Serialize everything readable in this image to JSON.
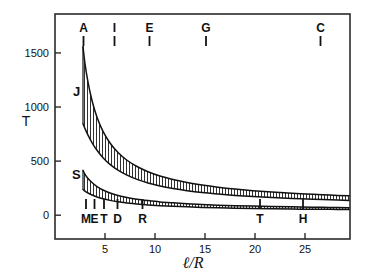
{
  "chart_data": {
    "type": "area",
    "title": "",
    "xlabel": "ℓ/R",
    "ylabel": "T",
    "xlim": [
      0,
      29.5
    ],
    "ylim": [
      -220,
      1860
    ],
    "grid": false,
    "legend": "none",
    "x_ticks": [
      5,
      10,
      15,
      20,
      25
    ],
    "x_tick_labels": [
      "5",
      "10",
      "15",
      "20",
      "25"
    ],
    "y_ticks": [
      0,
      500,
      1000,
      1500
    ],
    "y_tick_labels": [
      "0",
      "500",
      "1000",
      "1500"
    ],
    "series": [
      {
        "name": "J",
        "label": "J",
        "label_x": 3.0,
        "label_y": 1150,
        "fill": "hatch-vertical",
        "x": [
          2.8,
          3.0,
          3.3,
          3.7,
          4.2,
          4.8,
          5.5,
          6.3,
          7.2,
          8.2,
          9.3,
          10.5,
          11.8,
          13.2,
          14.7,
          16.3,
          18.0,
          19.8,
          21.7,
          23.7,
          25.8,
          27.5,
          29.4
        ],
        "upper": [
          1560,
          1400,
          1230,
          1060,
          905,
          775,
          668,
          580,
          508,
          450,
          402,
          362,
          330,
          302,
          279,
          259,
          242,
          227,
          214,
          203,
          193,
          186,
          179
        ],
        "lower": [
          845,
          800,
          740,
          672,
          600,
          532,
          470,
          416,
          370,
          331,
          298,
          270,
          247,
          227,
          210,
          196,
          183,
          172,
          163,
          154,
          147,
          142,
          137
        ]
      },
      {
        "name": "S",
        "label": "S",
        "label_x": 2.9,
        "label_y": 385,
        "fill": "hatch-vertical",
        "x": [
          2.8,
          3.0,
          3.3,
          3.7,
          4.2,
          4.8,
          5.5,
          6.3,
          7.2,
          8.2,
          9.3,
          10.5,
          11.8,
          13.2,
          14.7,
          16.3,
          18.0,
          19.8,
          21.7,
          23.7,
          25.8,
          27.5,
          29.4
        ],
        "upper": [
          415,
          378,
          340,
          302,
          265,
          233,
          206,
          183,
          164,
          148,
          135,
          123,
          114,
          106,
          99,
          93,
          88,
          84,
          80,
          77,
          74,
          72,
          70
        ],
        "lower": [
          238,
          222,
          205,
          187,
          169,
          152,
          137,
          124,
          113,
          103,
          95,
          88,
          82,
          77,
          72,
          68,
          65,
          62,
          59,
          57,
          55,
          54,
          52
        ]
      }
    ],
    "top_markers": [
      {
        "label": "A",
        "x": 2.85
      },
      {
        "label": "I",
        "x": 5.95
      },
      {
        "label": "E",
        "x": 9.45
      },
      {
        "label": "G",
        "x": 15.1
      },
      {
        "label": "C",
        "x": 26.55
      }
    ],
    "bottom_markers": [
      {
        "label": "M",
        "x": 3.1
      },
      {
        "label": "E",
        "x": 3.95
      },
      {
        "label": "T",
        "x": 4.9
      },
      {
        "label": "D",
        "x": 6.25
      },
      {
        "label": "R",
        "x": 8.75
      },
      {
        "label": "T",
        "x": 20.5
      },
      {
        "label": "H",
        "x": 24.8
      }
    ]
  }
}
